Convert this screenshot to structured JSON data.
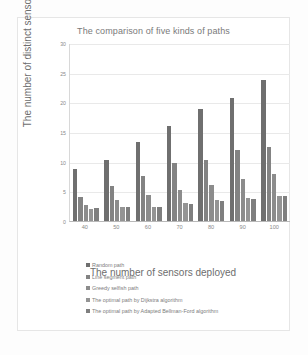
{
  "chart_data": {
    "type": "bar",
    "title": "The comparison of five kinds of paths",
    "xlabel": "The number of sensors deployed",
    "ylabel": "The number of distinct sensors crossed",
    "categories": [
      "40",
      "50",
      "60",
      "70",
      "80",
      "90",
      "100"
    ],
    "ylim": [
      0,
      30
    ],
    "yticks": [
      "0",
      "5",
      "10",
      "15",
      "20",
      "25",
      "30"
    ],
    "grid": true,
    "legend_position": "bottom",
    "series": [
      {
        "name": "Random path",
        "color": "#6f6f6f",
        "values": [
          8.8,
          10.3,
          13.3,
          16.0,
          18.8,
          20.8,
          23.8
        ]
      },
      {
        "name": "Line segment  path",
        "color": "#838383",
        "values": [
          4.1,
          5.9,
          7.6,
          9.7,
          10.2,
          11.9,
          12.4
        ]
      },
      {
        "name": "Greedy selfish path",
        "color": "#8c8c8c",
        "values": [
          2.7,
          3.5,
          4.4,
          5.2,
          6.0,
          7.0,
          8.0
        ]
      },
      {
        "name": "The optimal path by Dijkstra algorithm",
        "color": "#949494",
        "values": [
          2.1,
          2.3,
          2.4,
          3.0,
          3.5,
          3.8,
          4.3
        ]
      },
      {
        "name": "The optimal path by Adapted Bellman-Ford algorithm",
        "color": "#7f7f7f",
        "values": [
          2.2,
          2.3,
          2.4,
          2.9,
          3.4,
          3.7,
          4.2
        ]
      }
    ]
  }
}
